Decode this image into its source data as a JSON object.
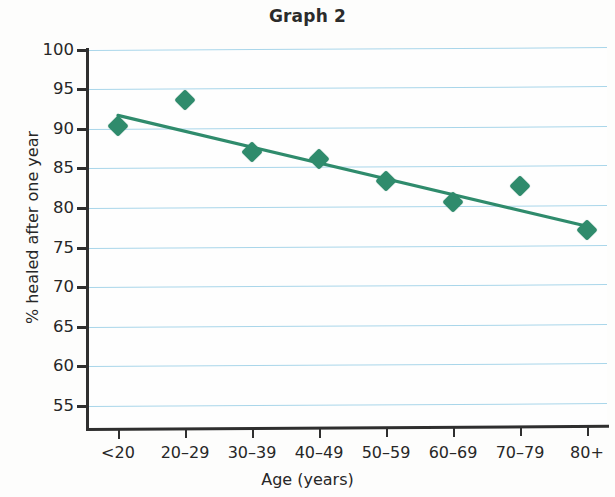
{
  "chart_data": {
    "type": "scatter",
    "title": "Graph 2",
    "xlabel": "Age (years)",
    "ylabel": "% healed after one year",
    "categories": [
      "<20",
      "20–29",
      "30–39",
      "40–49",
      "50–59",
      "60–69",
      "70–79",
      "80+"
    ],
    "values": [
      90.4,
      93.7,
      87.1,
      86.2,
      83.4,
      80.8,
      82.8,
      77.2
    ],
    "ylim": [
      52,
      100
    ],
    "yticks": [
      55,
      60,
      65,
      70,
      75,
      80,
      85,
      90,
      95,
      100
    ],
    "ytick_labels": [
      "55",
      "60",
      "65",
      "70",
      "75",
      "80",
      "85",
      "90",
      "95",
      "100"
    ],
    "grid": true,
    "grid_color": "#a9d6ea",
    "legend": false,
    "marker": "diamond",
    "marker_color": "#2f8b6c",
    "series": [
      {
        "name": "% healed after one year",
        "values": [
          90.4,
          93.7,
          87.1,
          86.2,
          83.4,
          80.8,
          82.8,
          77.2
        ]
      }
    ],
    "trendline": {
      "type": "linear",
      "color": "#2f8b6c",
      "start": {
        "x": "<20",
        "y": 91.7
      },
      "end": {
        "x": "80+",
        "y": 77.7
      }
    }
  }
}
